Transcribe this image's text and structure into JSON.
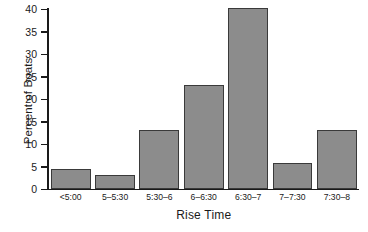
{
  "chart_data": {
    "type": "bar",
    "title": "",
    "xlabel": "Rise Time",
    "ylabel": "Percent of Boats",
    "categories": [
      "<5:00",
      "5–5:30",
      "5:30–6",
      "6–6:30",
      "6:30–7",
      "7–7:30",
      "7:30–8"
    ],
    "values": [
      4.4,
      3,
      13,
      23,
      40,
      5.7,
      13
    ],
    "ylim": [
      0,
      40
    ],
    "yticks": [
      0,
      5,
      10,
      15,
      20,
      25,
      30,
      35,
      40
    ],
    "ytick_labels": [
      "0",
      "5",
      "10",
      "15",
      "20",
      "25",
      "30",
      "35",
      "40"
    ],
    "grid": false,
    "legend": false,
    "bar_color": "#8c8c8c",
    "bar_edge_color": "#3a3a3a",
    "axis_color": "#1a1a1a"
  }
}
